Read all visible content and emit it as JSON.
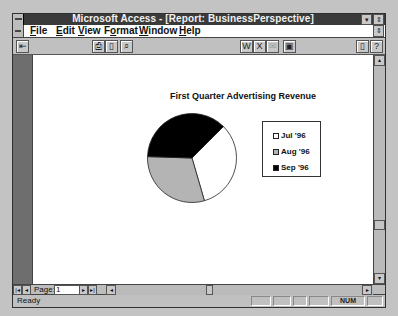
{
  "window": {
    "title": "Microsoft Access - [Report: BusinessPerspective]",
    "minimize_glyph": "▾",
    "restore_glyph": "⇕",
    "doc_restore_glyph": "⇕"
  },
  "menu": {
    "items": [
      {
        "label": "File",
        "accel": "F"
      },
      {
        "label": "Edit",
        "accel": "E"
      },
      {
        "label": "View",
        "accel": "V"
      },
      {
        "label": "Format",
        "accel": "o"
      },
      {
        "label": "Window",
        "accel": "W"
      },
      {
        "label": "Help",
        "accel": "H"
      }
    ]
  },
  "toolbar": {
    "buttons": [
      {
        "name": "close-report-icon",
        "glyph": "⇤"
      },
      {
        "name": "print-icon",
        "glyph": "⎙"
      },
      {
        "name": "page-setup-icon",
        "glyph": "▯"
      },
      {
        "name": "zoom-icon",
        "glyph": "⌕"
      },
      {
        "name": "output-to-word-icon",
        "glyph": "W"
      },
      {
        "name": "output-to-excel-icon",
        "glyph": "X"
      },
      {
        "name": "mail-icon",
        "glyph": "✉"
      },
      {
        "name": "database-window-icon",
        "glyph": "▣"
      },
      {
        "name": "cue-cards-icon",
        "glyph": "▯"
      },
      {
        "name": "help-pointer-icon",
        "glyph": "?"
      }
    ]
  },
  "chart_data": {
    "type": "pie",
    "title": "First Quarter Advertising Revenue",
    "categories": [
      "Jul '96",
      "Aug '96",
      "Sep '96"
    ],
    "values": [
      33,
      30,
      37
    ],
    "colors": [
      "#ffffff",
      "#b4b4b4",
      "#000000"
    ],
    "start_angle_deg": 45,
    "legend_position": "right"
  },
  "legend": {
    "items": [
      {
        "label": "Jul '96",
        "color": "#ffffff"
      },
      {
        "label": "Aug '96",
        "color": "#b4b4b4"
      },
      {
        "label": "Sep '96",
        "color": "#000000"
      }
    ]
  },
  "navigation": {
    "first_glyph": "|◂",
    "prev_glyph": "◂",
    "page_label": "Page:",
    "page_value": "1",
    "next_glyph": "▸",
    "last_glyph": "▸|",
    "scroll_left_glyph": "◂",
    "scroll_right_glyph": "▸"
  },
  "scrollbar": {
    "up_glyph": "▴",
    "down_glyph": "▾"
  },
  "status": {
    "text": "Ready",
    "num_indicator": "NUM"
  }
}
